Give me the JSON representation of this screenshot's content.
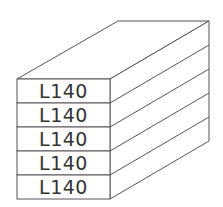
{
  "diagram": {
    "type": "stacked-box-isometric",
    "stack_count": 5,
    "layers": [
      {
        "label": "L140"
      },
      {
        "label": "L140"
      },
      {
        "label": "L140"
      },
      {
        "label": "L140"
      },
      {
        "label": "L140"
      }
    ],
    "colors": {
      "stroke": "#555555",
      "text": "#333333",
      "fill": "#ffffff"
    }
  }
}
